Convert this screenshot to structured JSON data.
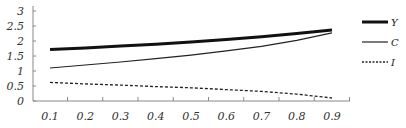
{
  "chart_data": {
    "type": "line",
    "title": "",
    "xlabel": "",
    "ylabel": "",
    "x": [
      0.1,
      0.2,
      0.3,
      0.4,
      0.5,
      0.6,
      0.7,
      0.8,
      0.9
    ],
    "xticks": [
      "0.1",
      "0.2",
      "0.3",
      "0.4",
      "0.5",
      "0.6",
      "0.7",
      "0.8",
      "0.9"
    ],
    "yticks": [
      "0",
      "0.5",
      "1",
      "1.5",
      "2",
      "2.5",
      "3"
    ],
    "ylim": [
      0,
      3
    ],
    "xlim": [
      0.05,
      0.95
    ],
    "grid": false,
    "legend_position": "right",
    "series": [
      {
        "name": "Y",
        "style": "thick-solid",
        "color": "#111111",
        "values": [
          1.72,
          1.77,
          1.83,
          1.89,
          1.97,
          2.05,
          2.14,
          2.25,
          2.37
        ]
      },
      {
        "name": "C",
        "style": "thin-solid",
        "color": "#222222",
        "values": [
          1.1,
          1.2,
          1.3,
          1.41,
          1.53,
          1.67,
          1.82,
          2.02,
          2.27
        ]
      },
      {
        "name": "I",
        "style": "dashed",
        "color": "#222222",
        "values": [
          0.62,
          0.57,
          0.53,
          0.48,
          0.44,
          0.38,
          0.32,
          0.23,
          0.1
        ]
      }
    ]
  }
}
